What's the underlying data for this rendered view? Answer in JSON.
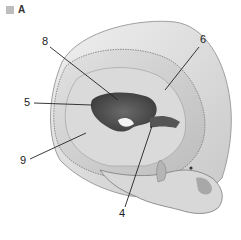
{
  "figure": {
    "panel_letter": "A",
    "panel_swatch_color": "#bdbdbd",
    "colors": {
      "bone_light": "#e6e6e6",
      "bone_mid": "#cfcfcf",
      "bone_shadow": "#9a9a9a",
      "cavity_dark": "#4a4a4a",
      "leader_line": "#222222"
    },
    "labels": [
      {
        "id": "label-8",
        "text": "8",
        "x": 42,
        "y": 36,
        "line": [
          50,
          47,
          118,
          100
        ]
      },
      {
        "id": "label-6",
        "text": "6",
        "x": 200,
        "y": 34,
        "line": [
          199,
          47,
          165,
          90
        ]
      },
      {
        "id": "label-5",
        "text": "5",
        "x": 24,
        "y": 97,
        "line": [
          34,
          103,
          92,
          105
        ]
      },
      {
        "id": "label-9",
        "text": "9",
        "x": 20,
        "y": 155,
        "line": [
          30,
          159,
          86,
          133
        ]
      },
      {
        "id": "label-4",
        "text": "4",
        "x": 119,
        "y": 208,
        "line": [
          125,
          207,
          152,
          126
        ]
      }
    ]
  }
}
